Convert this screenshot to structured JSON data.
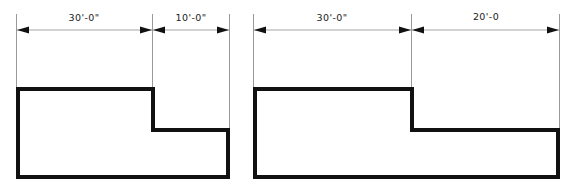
{
  "sheet": {
    "width": 575,
    "height": 192,
    "background_color": "#ffffff",
    "line_color": "#111111",
    "thin_line_color": "#8d8d8d",
    "text_color": "#1a1a1a",
    "description": "Two architectural floor-plan outlines with horizontal dimension strings"
  },
  "drawings": [
    {
      "id": "left-plan",
      "name": "left-plan",
      "shape": "L-shaped plan, notch at upper right",
      "dimensions": [
        {
          "id": "left-dim-1",
          "label": "30'-0\"",
          "feet": 30,
          "inches": 0,
          "span_start_x": 16,
          "span_end_x": 152,
          "label_x": 84,
          "label_y": 21
        },
        {
          "id": "left-dim-2",
          "label": "10'-0\"",
          "feet": 10,
          "inches": 0,
          "span_start_x": 152,
          "span_end_x": 230,
          "label_x": 191,
          "label_y": 21
        }
      ],
      "outline_points": "18,89 153,89 153,130 228,130 228,177 18,177",
      "step_x": 153,
      "top_y": 89,
      "step_y": 130,
      "bottom_y": 177,
      "left_x": 18,
      "right_x": 228
    },
    {
      "id": "right-plan",
      "name": "right-plan",
      "shape": "L-shaped plan, notch at upper right",
      "dimensions": [
        {
          "id": "right-dim-1",
          "label": "30'-0\"",
          "feet": 30,
          "inches": 0,
          "span_start_x": 253,
          "span_end_x": 411,
          "label_x": 332,
          "label_y": 21
        },
        {
          "id": "right-dim-2",
          "label": "20'-0",
          "feet": 20,
          "inches": 0,
          "span_start_x": 411,
          "span_end_x": 560,
          "label_x": 486,
          "label_y": 20
        }
      ],
      "outline_points": "255,89 412,89 412,130 558,130 558,177 255,177",
      "step_x": 412,
      "top_y": 89,
      "step_y": 130,
      "bottom_y": 177,
      "left_x": 255,
      "right_x": 558
    }
  ],
  "dimension_line_y": 30,
  "extension_line_top_y": 14
}
